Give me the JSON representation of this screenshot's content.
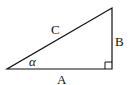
{
  "diagram": {
    "type": "right-triangle",
    "labels": {
      "hypotenuse": "C",
      "opposite": "B",
      "adjacent": "A",
      "angle": "α"
    },
    "colors": {
      "stroke": "#111111",
      "background": "#ffffff"
    }
  }
}
